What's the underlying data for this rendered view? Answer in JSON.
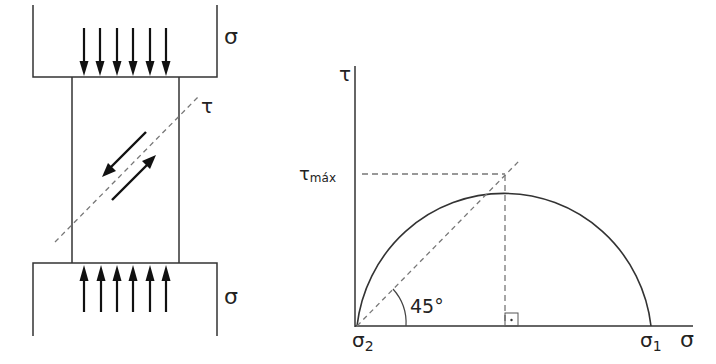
{
  "specimen": {
    "sigma_top_label": "σ",
    "sigma_bottom_label": "σ",
    "tau_plane_label": "τ",
    "compression_arrow_count": 6
  },
  "mohr_circle": {
    "y_axis_label": "τ",
    "x_axis_label": "σ",
    "tau_max_label": "τ",
    "tau_max_subscript": "máx",
    "sigma2_label": "σ",
    "sigma2_subscript": "2",
    "sigma1_label": "σ",
    "sigma1_subscript": "1",
    "angle_label": "45°"
  },
  "colors": {
    "line": "#333333",
    "dashed": "#777777",
    "arrow": "#111111"
  }
}
